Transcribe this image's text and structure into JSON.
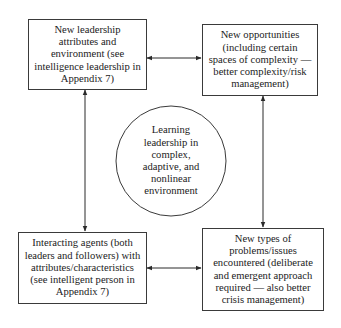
{
  "diagram": {
    "nodes": {
      "top_left": {
        "text": "New leadership attributes and environment (see intelligence leadership in Appendix 7)",
        "lines": [
          "New leadership",
          "attributes and",
          "environment (see",
          "intelligence leadership in",
          "Appendix 7)"
        ]
      },
      "top_right": {
        "text": "New opportunities (including certain spaces of complexity — better complexity/risk management)",
        "lines": [
          "New opportunities",
          "(including certain",
          "spaces of complexity —",
          "better complexity/risk",
          "management)"
        ]
      },
      "center": {
        "text": "Learning leadership in complex, adaptive, and nonlinear environment",
        "lines": [
          "Learning",
          "leadership in",
          "complex,",
          "adaptive, and",
          "nonlinear",
          "environment"
        ]
      },
      "bottom_left": {
        "text": "Interacting agents (both leaders and followers) with attributes/characteristics (see intelligent person in Appendix 7)",
        "lines": [
          "Interacting agents (both",
          "leaders and followers) with",
          "attributes/characteristics",
          "(see intelligent person in",
          "Appendix 7)"
        ]
      },
      "bottom_right": {
        "text": "New types of problems/issues encountered (deliberate and emergent approach required — also better crisis management)",
        "lines": [
          "New types of",
          "problems/issues",
          "encountered (deliberate",
          "and emergent approach",
          "required — also better",
          "crisis management)"
        ]
      }
    },
    "edges": [
      {
        "from": "top_left",
        "to": "top_right",
        "direction": "bidirectional"
      },
      {
        "from": "top_left",
        "to": "bottom_left",
        "direction": "bidirectional"
      },
      {
        "from": "top_right",
        "to": "bottom_right",
        "direction": "bidirectional"
      },
      {
        "from": "bottom_left",
        "to": "bottom_right",
        "direction": "bidirectional"
      }
    ],
    "colors": {
      "stroke": "#3a3a3a",
      "text": "#222222",
      "background": "#ffffff"
    }
  }
}
